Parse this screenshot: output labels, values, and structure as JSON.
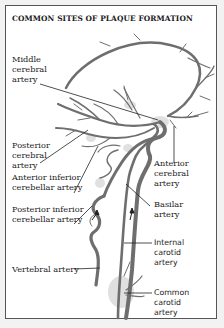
{
  "title": "COMMON SITES OF PLAQUE FORMATION",
  "labels": {
    "middle_cerebral": [
      "Middle",
      "cerebral",
      "artery"
    ],
    "posterior_cerebral": [
      "Posterior",
      "cerebral",
      "artery"
    ],
    "anterior_inferior_cerebellar": [
      "Anterior inferior",
      "cerebellar artery"
    ],
    "posterior_inferior_cerebellar": [
      "Posterior inferior",
      "cerebellar artery"
    ],
    "vertebral": [
      "Vertebral artery"
    ],
    "anterior_cerebral": [
      "Anterior",
      "cerebral",
      "artery"
    ],
    "basilar": [
      "Basilar",
      "artery"
    ],
    "internal_carotid": [
      "Internal",
      "carotid",
      "artery"
    ],
    "common_carotid": [
      "Common",
      "carotid",
      "artery"
    ]
  },
  "colors": {
    "artery": "#6e6e6e",
    "plaque_halo": "#c8c8c8",
    "leader_line": "#222222",
    "frame": "#555555"
  }
}
